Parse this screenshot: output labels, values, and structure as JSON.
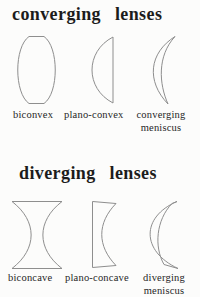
{
  "page": {
    "background_color": "#fcfcfb",
    "line_color": "#8e8e8e",
    "title_color": "#1c1c1c",
    "label_color": "#262626"
  },
  "sections": [
    {
      "id": "converging",
      "title": "converging lenses",
      "lenses": [
        {
          "name": "biconvex-lens-shape",
          "label": "biconvex"
        },
        {
          "name": "plano-convex-lens-shape",
          "label": "plano-convex"
        },
        {
          "name": "converging-meniscus-lens-shape",
          "label": "converging meniscus"
        }
      ]
    },
    {
      "id": "diverging",
      "title": "diverging lenses",
      "lenses": [
        {
          "name": "biconcave-lens-shape",
          "label": "biconcave"
        },
        {
          "name": "plano-concave-lens-shape",
          "label": "plano-concave"
        },
        {
          "name": "diverging-meniscus-lens-shape",
          "label": "diverging meniscus"
        }
      ]
    }
  ]
}
